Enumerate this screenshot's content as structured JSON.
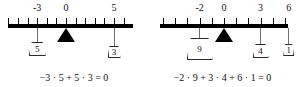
{
  "figures": [
    {
      "id": "left",
      "ruler": {
        "x_start": 8,
        "x_end": 133,
        "unit_px": 9.6,
        "zero_px": 66,
        "tick_min": -6,
        "tick_max": 6,
        "labels": [
          {
            "value": "-3",
            "pos": -3
          },
          {
            "value": "0",
            "pos": 0
          },
          {
            "value": "5",
            "pos": 5
          }
        ]
      },
      "fulcrum": {
        "pos": 0,
        "name": "fulcrum-triangle"
      },
      "weights": [
        {
          "label": "5",
          "pos": -3,
          "w": 17,
          "h": 14,
          "drop": 14
        },
        {
          "label": "3",
          "pos": 5,
          "w": 13,
          "h": 12,
          "drop": 18
        }
      ],
      "equation": "−3 · 5 + 5 · 3 = 0"
    },
    {
      "id": "right",
      "ruler": {
        "x_start": 12,
        "x_end": 140,
        "unit_px": 12.2,
        "zero_px": 76,
        "tick_min": -5,
        "tick_max": 5,
        "labels": [
          {
            "value": "-2",
            "pos": -2
          },
          {
            "value": "0",
            "pos": 0
          },
          {
            "value": "3",
            "pos": 3
          },
          {
            "value": "6",
            "pos": 5.3
          }
        ]
      },
      "fulcrum": {
        "pos": 0,
        "name": "fulcrum-triangle"
      },
      "weights": [
        {
          "label": "9",
          "pos": -2,
          "w": 26,
          "h": 22,
          "drop": 10
        },
        {
          "label": "4",
          "pos": 3,
          "w": 16,
          "h": 14,
          "drop": 16
        },
        {
          "label": "1",
          "pos": 5.3,
          "w": 11,
          "h": 12,
          "drop": 16
        }
      ],
      "equation": "−2 · 9 + 3 · 4 + 6 · 1 = 0"
    }
  ]
}
